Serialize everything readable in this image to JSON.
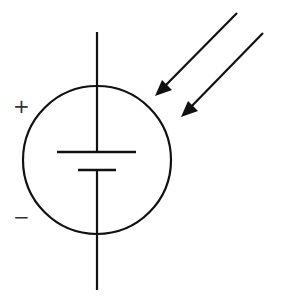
{
  "diagram": {
    "labels": {
      "positive": "+",
      "negative": "−"
    },
    "elements": [
      "circle",
      "battery-plates",
      "terminal-leads",
      "light-arrows"
    ],
    "colors": {
      "stroke": "#111111",
      "background": "#ffffff"
    }
  }
}
